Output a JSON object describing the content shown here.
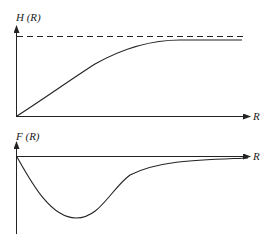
{
  "diagram": {
    "top_plot": {
      "y_label": "H (R)",
      "x_label": "R",
      "curve": "monotonic rise from origin approaching asymptote",
      "asymptote": "dashed horizontal line"
    },
    "bottom_plot": {
      "y_label": "F (R)",
      "x_label": "R",
      "curve": "dips below axis to a minimum then returns toward zero"
    },
    "colors": {
      "line": "#222222",
      "background": "#ffffff"
    }
  }
}
